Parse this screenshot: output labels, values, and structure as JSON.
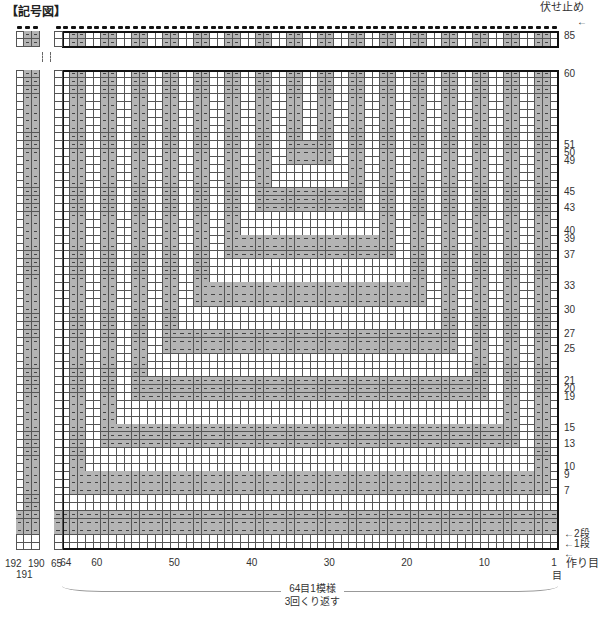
{
  "title": "【記号図】",
  "chart": {
    "columns": 64,
    "rows_main": 60,
    "rows_top_section": [
      84,
      85
    ],
    "left_extra_columns": [
      "192",
      "191",
      "190"
    ],
    "col_65_label": "65",
    "purl_color": "#b4b4b4",
    "knit_color": "#ffffff",
    "purl_symbol": "−",
    "vertical_purl_columns_mod4": [
      2,
      3
    ],
    "horizontal_bands": [
      {
        "rows": [
          2,
          4
        ],
        "from_col": 1,
        "to_col": 64
      },
      {
        "rows": [
          7,
          9
        ],
        "from_col": 3,
        "to_col": 62
      },
      {
        "rows": [
          13,
          15
        ],
        "from_col": 7,
        "to_col": 58
      },
      {
        "rows": [
          19,
          21
        ],
        "from_col": 11,
        "to_col": 54
      },
      {
        "rows": [
          25,
          27
        ],
        "from_col": 15,
        "to_col": 50
      },
      {
        "rows": [
          31,
          33
        ],
        "from_col": 19,
        "to_col": 46
      },
      {
        "rows": [
          37,
          39
        ],
        "from_col": 23,
        "to_col": 42
      },
      {
        "rows": [
          43,
          45
        ],
        "from_col": 27,
        "to_col": 38
      },
      {
        "rows": [
          49,
          51
        ],
        "from_col": 31,
        "to_col": 34
      }
    ],
    "u_shapes_note": "nested U shapes: vertical 2-stitch purl columns terminate at the horizontal band closing each U"
  },
  "labels": {
    "bind_off": "伏せ止め",
    "row_top": "85",
    "row_numbers_right": [
      "60",
      "51",
      "50",
      "49",
      "45",
      "43",
      "40",
      "39",
      "37",
      "33",
      "30",
      "27",
      "25",
      "21",
      "20",
      "19",
      "15",
      "13",
      "10",
      "9",
      "7"
    ],
    "row_2": "←2段",
    "row_1": "←1段",
    "cast_on_arrow": "←",
    "cast_on": "作り目",
    "col_numbers_bottom": [
      {
        "label": "64",
        "col": 64
      },
      {
        "label": "60",
        "col": 60
      },
      {
        "label": "50",
        "col": 50
      },
      {
        "label": "40",
        "col": 40
      },
      {
        "label": "30",
        "col": 30
      },
      {
        "label": "20",
        "col": 20
      },
      {
        "label": "10",
        "col": 10
      },
      {
        "label": "1",
        "col": 1
      }
    ],
    "col_1_unit": "目",
    "left_col_labels": [
      "192",
      "190"
    ],
    "left_col_label_under": "191",
    "repeat_line1": "64目1模様",
    "repeat_line2": "3回くり返す"
  }
}
